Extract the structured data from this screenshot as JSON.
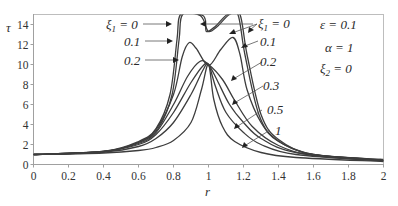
{
  "chart_data": {
    "type": "line",
    "title": "",
    "xlabel": "r",
    "ylabel": "τ",
    "xlim": [
      0,
      2
    ],
    "ylim": [
      0,
      15
    ],
    "x_ticks": [
      "0",
      "0.2",
      "0.4",
      "0.6",
      "0.8",
      "1",
      "1.2",
      "1.4",
      "1.6",
      "1.8",
      "2"
    ],
    "y_ticks": [
      "0",
      "2",
      "4",
      "6",
      "8",
      "10",
      "12",
      "14"
    ],
    "grid": false,
    "legend": "none (inline annotations)",
    "parameters": {
      "epsilon": "ε = 0.1",
      "alpha": "α = 1",
      "xi2": "ξ2 = 0"
    },
    "annotations": [
      "ξ1 = 0",
      "0.1",
      "0.2",
      "ξ1 = 0",
      "0.1",
      "0.2",
      "0.3",
      "0.5",
      "1"
    ],
    "series": [
      {
        "name": "ξ1 = 0",
        "description": "two resonance branches diverging near r≈0.83 and r≈1.2, exceeding plot top",
        "points": [
          [
            0,
            1.0
          ],
          [
            0.4,
            1.3
          ],
          [
            0.6,
            2.3
          ],
          [
            0.7,
            3.6
          ],
          [
            0.78,
            7.0
          ],
          [
            0.82,
            12.5
          ],
          [
            0.84,
            15
          ],
          [
            0.94,
            15
          ],
          [
            0.97,
            14.5
          ],
          [
            1.0,
            13.3
          ],
          [
            1.05,
            13.8
          ],
          [
            1.12,
            15
          ],
          [
            1.18,
            15
          ],
          [
            1.22,
            11
          ],
          [
            1.3,
            5
          ],
          [
            1.4,
            2.5
          ],
          [
            1.6,
            1.0
          ],
          [
            2.0,
            0.5
          ]
        ]
      },
      {
        "name": "ξ1 = 0.1",
        "points": [
          [
            0,
            1.0
          ],
          [
            0.4,
            1.3
          ],
          [
            0.6,
            2.2
          ],
          [
            0.7,
            3.5
          ],
          [
            0.8,
            7.0
          ],
          [
            0.85,
            10.8
          ],
          [
            0.89,
            12.2
          ],
          [
            0.93,
            11.6
          ],
          [
            1.0,
            9.9
          ],
          [
            1.07,
            11.5
          ],
          [
            1.14,
            12.7
          ],
          [
            1.18,
            11.0
          ],
          [
            1.22,
            7.5
          ],
          [
            1.3,
            4.2
          ],
          [
            1.4,
            2.3
          ],
          [
            1.6,
            1.0
          ],
          [
            2.0,
            0.4
          ]
        ]
      },
      {
        "name": "ξ1 = 0.2",
        "points": [
          [
            0,
            1.0
          ],
          [
            0.4,
            1.3
          ],
          [
            0.6,
            2.1
          ],
          [
            0.7,
            3.2
          ],
          [
            0.8,
            6.0
          ],
          [
            0.88,
            8.8
          ],
          [
            0.95,
            10.3
          ],
          [
            1.0,
            10.0
          ],
          [
            1.08,
            8.5
          ],
          [
            1.15,
            6.4
          ],
          [
            1.25,
            3.8
          ],
          [
            1.4,
            1.9
          ],
          [
            1.6,
            0.9
          ],
          [
            2.0,
            0.4
          ]
        ]
      },
      {
        "name": "ξ1 = 0.3",
        "points": [
          [
            0,
            1.0
          ],
          [
            0.4,
            1.3
          ],
          [
            0.6,
            2.0
          ],
          [
            0.7,
            3.0
          ],
          [
            0.8,
            5.2
          ],
          [
            0.9,
            8.2
          ],
          [
            0.97,
            9.9
          ],
          [
            1.0,
            10.0
          ],
          [
            1.05,
            8.4
          ],
          [
            1.12,
            6.0
          ],
          [
            1.2,
            4.2
          ],
          [
            1.3,
            2.6
          ],
          [
            1.5,
            1.2
          ],
          [
            2.0,
            0.4
          ]
        ]
      },
      {
        "name": "ξ1 = 0.5",
        "points": [
          [
            0,
            1.0
          ],
          [
            0.4,
            1.25
          ],
          [
            0.6,
            1.8
          ],
          [
            0.7,
            2.6
          ],
          [
            0.8,
            4.2
          ],
          [
            0.9,
            7.0
          ],
          [
            0.97,
            9.5
          ],
          [
            1.0,
            10.0
          ],
          [
            1.04,
            7.8
          ],
          [
            1.1,
            5.2
          ],
          [
            1.2,
            3.2
          ],
          [
            1.3,
            2.0
          ],
          [
            1.5,
            1.0
          ],
          [
            2.0,
            0.35
          ]
        ]
      },
      {
        "name": "ξ1 = 1",
        "points": [
          [
            0,
            1.0
          ],
          [
            0.4,
            1.15
          ],
          [
            0.6,
            1.4
          ],
          [
            0.7,
            1.7
          ],
          [
            0.8,
            2.4
          ],
          [
            0.9,
            4.2
          ],
          [
            0.96,
            7.5
          ],
          [
            1.0,
            10.0
          ],
          [
            1.03,
            6.5
          ],
          [
            1.08,
            3.8
          ],
          [
            1.15,
            2.3
          ],
          [
            1.3,
            1.2
          ],
          [
            1.5,
            0.7
          ],
          [
            2.0,
            0.3
          ]
        ]
      }
    ]
  },
  "labels": {
    "y_axis": "τ",
    "x_axis": "r",
    "left_xi0": "ξ",
    "left_xi0_sub": "1",
    "left_xi0_val": " = 0",
    "left_01": "0.1",
    "left_02": "0.2",
    "right_xi0": "ξ",
    "right_xi0_sub": "1",
    "right_xi0_val": " = 0",
    "right_01": "0.1",
    "right_02": "0.2",
    "right_03": "0.3",
    "right_05": "0.5",
    "right_1": "1",
    "eps": "ε = 0.1",
    "alpha": "α = 1",
    "xi2": "ξ",
    "xi2_sub": "2",
    "xi2_val": " = 0"
  }
}
